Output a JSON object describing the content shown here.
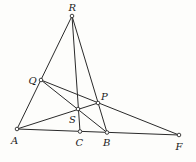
{
  "diagram": {
    "type": "geometry-figure",
    "points": [
      {
        "id": "R",
        "label": "R",
        "x": 72,
        "y": 16,
        "lx": 68.5,
        "ly": 11
      },
      {
        "id": "Q",
        "label": "Q",
        "x": 41,
        "y": 80,
        "lx": 28.5,
        "ly": 84
      },
      {
        "id": "P",
        "label": "P",
        "x": 98,
        "y": 103,
        "lx": 101,
        "ly": 100
      },
      {
        "id": "S",
        "label": "S",
        "x": 78,
        "y": 109,
        "lx": 69,
        "ly": 123
      },
      {
        "id": "A",
        "label": "A",
        "x": 17,
        "y": 129,
        "lx": 11,
        "ly": 144
      },
      {
        "id": "C",
        "label": "C",
        "x": 80,
        "y": 131.5,
        "lx": 75.5,
        "ly": 146
      },
      {
        "id": "B",
        "label": "B",
        "x": 107,
        "y": 132.5,
        "lx": 103,
        "ly": 146
      },
      {
        "id": "F",
        "label": "F",
        "x": 179,
        "y": 135,
        "lx": 175.5,
        "ly": 150
      }
    ],
    "segments": [
      [
        "R",
        "A"
      ],
      [
        "R",
        "C"
      ],
      [
        "R",
        "B"
      ],
      [
        "A",
        "F"
      ],
      [
        "Q",
        "F"
      ],
      [
        "Q",
        "B"
      ],
      [
        "A",
        "P"
      ]
    ],
    "stroke_color": "#2a2a2a",
    "label_color": "#1a1a1a"
  }
}
